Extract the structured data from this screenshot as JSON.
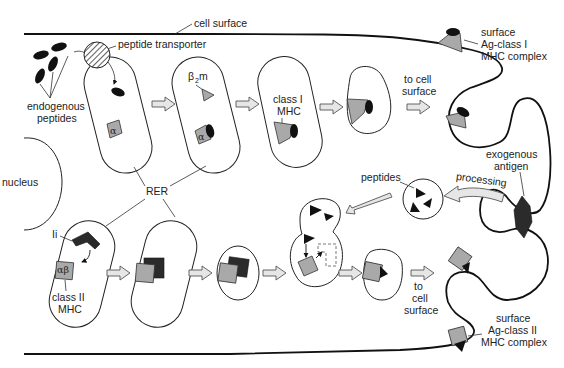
{
  "diagram": {
    "labels": {
      "cell_surface": "cell surface",
      "peptide_transporter": "peptide transporter",
      "endogenous_peptides_1": "endogenous",
      "endogenous_peptides_2": "peptides",
      "b2m_beta": "β",
      "b2m_sub": "2",
      "b2m_m": "m",
      "alpha": "α",
      "class1_mhc_1": "class I",
      "class1_mhc_2": "MHC",
      "to_cell_surface_top_1": "to cell",
      "to_cell_surface_top_2": "surface",
      "surface_class1_1": "surface",
      "surface_class1_2": "Ag-class I",
      "surface_class1_3": "MHC complex",
      "nucleus": "nucleus",
      "rer": "RER",
      "peptides": "peptides",
      "processing": "processing",
      "exogenous_antigen_1": "exogenous",
      "exogenous_antigen_2": "antigen",
      "ii": "Ii",
      "alpha_beta": "αβ",
      "class2_mhc_1": "class II",
      "class2_mhc_2": "MHC",
      "to_cell_surface_bottom_1": "to",
      "to_cell_surface_bottom_2": "cell",
      "to_cell_surface_bottom_3": "surface",
      "surface_class2_1": "surface",
      "surface_class2_2": "Ag-class II",
      "surface_class2_3": "MHC complex"
    },
    "colors": {
      "membrane": "#111111",
      "mhc_gray": "#a9a9a9",
      "invariant_chain": "#2b2b2b",
      "arrow_fill": "#e6e6e6",
      "peptide": "#111111"
    },
    "pathways": [
      {
        "name": "class I (endogenous)",
        "steps": [
          "peptide transport into RER",
          "α chain",
          "β2m association",
          "peptide loading",
          "vesicle",
          "surface Ag-class I MHC complex"
        ]
      },
      {
        "name": "class II (exogenous)",
        "steps": [
          "αβ + Ii in RER",
          "αβ-Ii complex",
          "vesicle",
          "fusion with peptide endosome, Ii release",
          "vesicle",
          "surface Ag-class II MHC complex"
        ]
      }
    ]
  }
}
